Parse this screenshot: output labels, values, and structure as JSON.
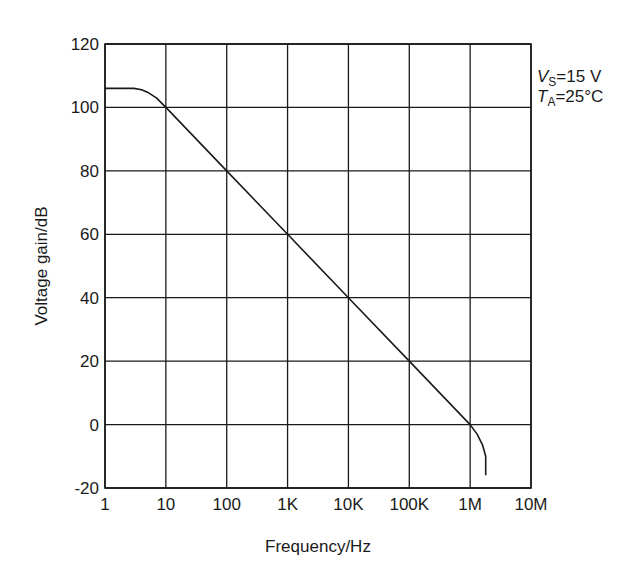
{
  "chart_data": {
    "type": "line",
    "title": "",
    "xlabel": "Frequency/Hz",
    "ylabel": "Voltage gain/dB",
    "xscale": "log",
    "xlim": [
      1,
      10000000
    ],
    "ylim": [
      -20,
      120
    ],
    "grid": true,
    "x_ticks": [
      1,
      10,
      100,
      1000,
      10000,
      100000,
      1000000,
      10000000
    ],
    "x_tick_labels": [
      "1",
      "10",
      "100",
      "1K",
      "10K",
      "100K",
      "1M",
      "10M"
    ],
    "y_ticks": [
      -20,
      0,
      20,
      40,
      60,
      80,
      100,
      120
    ],
    "y_tick_labels": [
      "-20",
      "0",
      "20",
      "40",
      "60",
      "80",
      "100",
      "120"
    ],
    "annotations": [
      {
        "main": "V",
        "sub": "S",
        "rest": "=15 V"
      },
      {
        "main": "T",
        "sub": "A",
        "rest": "=25°C"
      }
    ],
    "series": [
      {
        "name": "Open-loop voltage gain",
        "x": [
          1,
          3,
          4,
          5,
          7,
          10,
          100,
          1000,
          10000,
          100000,
          1000000,
          1300000,
          1600000,
          1800000,
          1800000
        ],
        "y": [
          106,
          106,
          105.6,
          104.8,
          103,
          100,
          80,
          60,
          40,
          20,
          0,
          -3,
          -6.5,
          -10,
          -16
        ]
      }
    ]
  },
  "colors": {
    "line": "#1a1a1a",
    "grid": "#1a1a1a",
    "background": "#ffffff"
  }
}
